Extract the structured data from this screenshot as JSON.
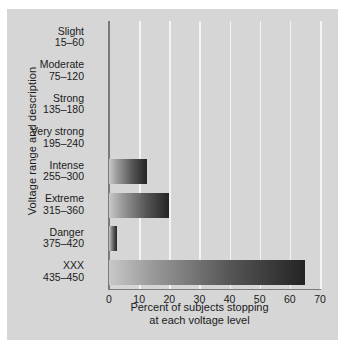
{
  "chart_data": {
    "type": "bar",
    "orientation": "horizontal",
    "title": "",
    "xlabel": "Percent of subjects stopping at each voltage level",
    "ylabel": "Voltage range and description",
    "xlim": [
      0,
      70
    ],
    "xticks": [
      0,
      10,
      20,
      30,
      40,
      50,
      60,
      70
    ],
    "xtick_labels": [
      "0",
      "10",
      "20",
      "30",
      "40",
      "50",
      "60",
      "70"
    ],
    "grid": true,
    "grid_axis": "x",
    "legend": false,
    "categories": [
      "Slight 15-60",
      "Moderate 75-120",
      "Strong 135-180",
      "Very strong 195-240",
      "Intense 255-300",
      "Extreme 315-360",
      "Danger 375-420",
      "XXX 435-450"
    ],
    "values": [
      0,
      0,
      0,
      0,
      12.5,
      20,
      2.5,
      65
    ],
    "category_rows": [
      {
        "name": "Slight",
        "range": "15–60",
        "value": 0
      },
      {
        "name": "Moderate",
        "range": "75–120",
        "value": 0
      },
      {
        "name": "Strong",
        "range": "135–180",
        "value": 0
      },
      {
        "name": "Very strong",
        "range": "195–240",
        "value": 0
      },
      {
        "name": "Intense",
        "range": "255–300",
        "value": 12.5
      },
      {
        "name": "Extreme",
        "range": "315–360",
        "value": 20
      },
      {
        "name": "Danger",
        "range": "375–420",
        "value": 2.5
      },
      {
        "name": "XXX",
        "range": "435–450",
        "value": 65
      }
    ],
    "colors": {
      "panel_background": "#d6d6d6",
      "page_background": "#ffffff",
      "gridline": "#f4f4f4",
      "axis": "#7a7a7a",
      "bar_gradient_start": "#c8c8c8",
      "bar_gradient_end": "#242424",
      "text": "#1b1b1b"
    }
  },
  "axis": {
    "y_title": "Voltage range and description",
    "x_title_line1": "Percent of subjects stopping",
    "x_title_line2": "at each voltage level"
  }
}
